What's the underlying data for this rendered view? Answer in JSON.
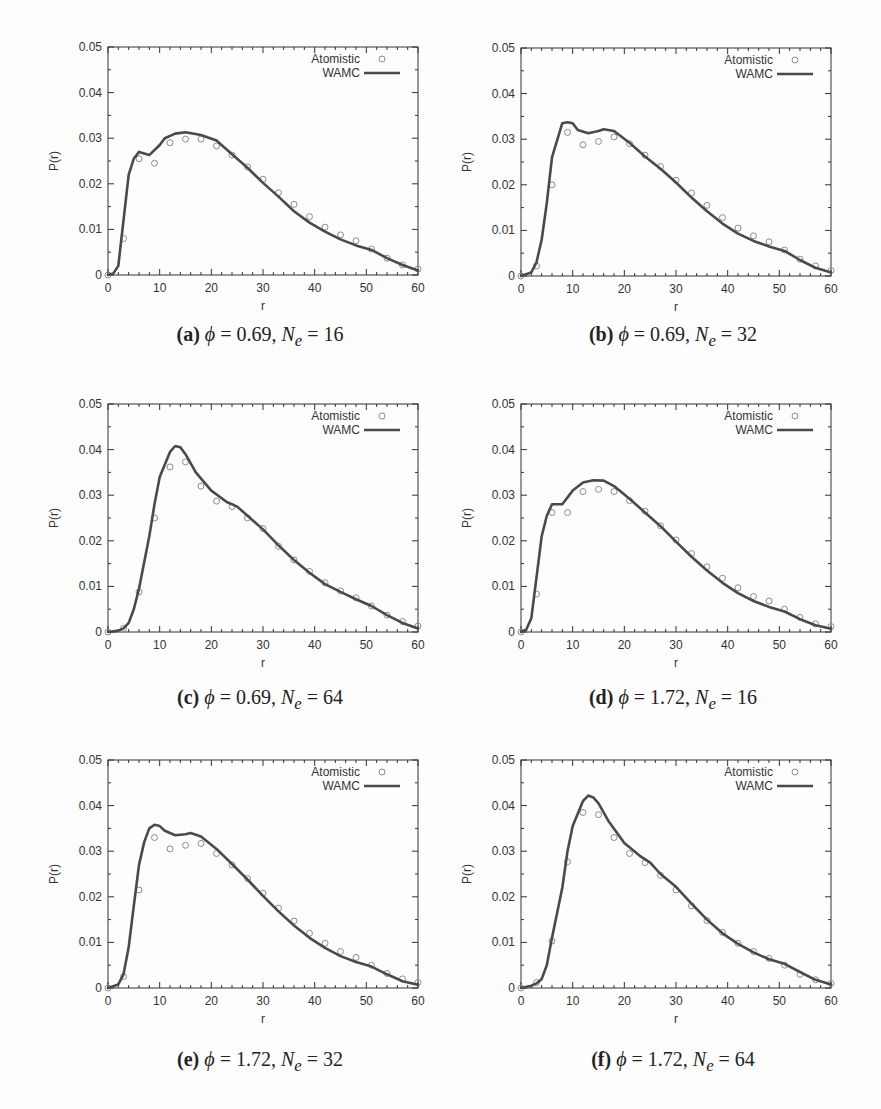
{
  "figure": {
    "panels": [
      {
        "id": "a",
        "label": "(a)",
        "phi": "0.69",
        "ne": "16"
      },
      {
        "id": "b",
        "label": "(b)",
        "phi": "0.69",
        "ne": "32"
      },
      {
        "id": "c",
        "label": "(c)",
        "phi": "0.69",
        "ne": "64"
      },
      {
        "id": "d",
        "label": "(d)",
        "phi": "1.72",
        "ne": "16"
      },
      {
        "id": "e",
        "label": "(e)",
        "phi": "1.72",
        "ne": "32"
      },
      {
        "id": "f",
        "label": "(f)",
        "phi": "1.72",
        "ne": "64"
      }
    ],
    "caption_phi_symbol": "ϕ",
    "caption_ne_symbol": "N",
    "caption_ne_sub": "e",
    "caption_eq": " = ",
    "caption_sep": ", "
  },
  "colors": {
    "curve": "#4a4a4a",
    "markers": "#8c8c8c",
    "axes": "#333333"
  },
  "chart_data": [
    {
      "type": "line",
      "panel": "a",
      "title": "(a) ϕ = 0.69, Ne = 16",
      "xlabel": "r",
      "ylabel": "P(r)",
      "xlim": [
        0,
        60
      ],
      "ylim": [
        0,
        0.05
      ],
      "xticks": [
        0,
        10,
        20,
        30,
        40,
        50,
        60
      ],
      "yticks": [
        "0",
        "0.01",
        "0.02",
        "0.03",
        "0.04",
        "0.05"
      ],
      "grid": false,
      "legend_position": "top-right",
      "series": [
        {
          "name": "Atomistic",
          "style": "open-circle",
          "x": [
            0,
            3,
            6,
            9,
            12,
            15,
            18,
            21,
            24,
            27,
            30,
            33,
            36,
            39,
            42,
            45,
            48,
            51,
            54,
            57,
            60
          ],
          "y": [
            0,
            0.008,
            0.0255,
            0.0245,
            0.029,
            0.0298,
            0.0298,
            0.0283,
            0.0263,
            0.0237,
            0.021,
            0.018,
            0.0155,
            0.0128,
            0.0105,
            0.0088,
            0.0075,
            0.0057,
            0.0037,
            0.0022,
            0.0013
          ]
        },
        {
          "name": "WAMC",
          "style": "line",
          "x": [
            0,
            1,
            2,
            3,
            4,
            5,
            6,
            8,
            10,
            11,
            13,
            15,
            18,
            21,
            24,
            27,
            30,
            33,
            36,
            39,
            42,
            45,
            48,
            51,
            54,
            57,
            60
          ],
          "y": [
            0,
            0.0003,
            0.002,
            0.012,
            0.022,
            0.0255,
            0.027,
            0.0263,
            0.0285,
            0.03,
            0.031,
            0.0313,
            0.0307,
            0.0295,
            0.0265,
            0.0235,
            0.0202,
            0.0172,
            0.014,
            0.0115,
            0.0095,
            0.0078,
            0.0065,
            0.0055,
            0.0037,
            0.0022,
            0.001
          ]
        }
      ]
    },
    {
      "type": "line",
      "panel": "b",
      "title": "(b) ϕ = 0.69, Ne = 32",
      "xlabel": "r",
      "ylabel": "P(r)",
      "xlim": [
        0,
        60
      ],
      "ylim": [
        0,
        0.05
      ],
      "xticks": [
        0,
        10,
        20,
        30,
        40,
        50,
        60
      ],
      "yticks": [
        "0",
        "0.01",
        "0.02",
        "0.03",
        "0.04",
        "0.05"
      ],
      "grid": false,
      "legend_position": "top-right",
      "series": [
        {
          "name": "Atomistic",
          "style": "open-circle",
          "x": [
            0,
            3,
            6,
            9,
            12,
            15,
            18,
            21,
            24,
            27,
            30,
            33,
            36,
            39,
            42,
            45,
            48,
            51,
            54,
            57,
            60
          ],
          "y": [
            0,
            0.0022,
            0.02,
            0.0315,
            0.0288,
            0.0295,
            0.0305,
            0.029,
            0.0265,
            0.024,
            0.021,
            0.0182,
            0.0155,
            0.0128,
            0.0105,
            0.0088,
            0.0075,
            0.0057,
            0.0037,
            0.0022,
            0.0012
          ]
        },
        {
          "name": "WAMC",
          "style": "line",
          "x": [
            0,
            2,
            3,
            4,
            5,
            6,
            8,
            9,
            10,
            11,
            13,
            15,
            16,
            18,
            21,
            24,
            27,
            30,
            33,
            36,
            39,
            42,
            45,
            48,
            51,
            54,
            57,
            60
          ],
          "y": [
            0,
            0.0008,
            0.003,
            0.008,
            0.016,
            0.026,
            0.0335,
            0.0337,
            0.0335,
            0.032,
            0.0313,
            0.0318,
            0.0322,
            0.0318,
            0.0292,
            0.0262,
            0.0235,
            0.0205,
            0.0172,
            0.0142,
            0.0115,
            0.0093,
            0.0077,
            0.0065,
            0.0055,
            0.0035,
            0.0018,
            0.0008
          ]
        }
      ]
    },
    {
      "type": "line",
      "panel": "c",
      "title": "(c) ϕ = 0.69, Ne = 64",
      "xlabel": "r",
      "ylabel": "P(r)",
      "xlim": [
        0,
        60
      ],
      "ylim": [
        0,
        0.05
      ],
      "xticks": [
        0,
        10,
        20,
        30,
        40,
        50,
        60
      ],
      "yticks": [
        "0",
        "0.01",
        "0.02",
        "0.03",
        "0.04",
        "0.05"
      ],
      "grid": false,
      "legend_position": "top-right",
      "series": [
        {
          "name": "Atomistic",
          "style": "open-circle",
          "x": [
            0,
            3,
            6,
            9,
            12,
            15,
            18,
            21,
            24,
            27,
            30,
            33,
            36,
            39,
            42,
            45,
            48,
            51,
            54,
            57,
            60
          ],
          "y": [
            0,
            0.0008,
            0.0088,
            0.025,
            0.0362,
            0.0373,
            0.032,
            0.0287,
            0.0275,
            0.025,
            0.0227,
            0.0188,
            0.0158,
            0.0133,
            0.0108,
            0.009,
            0.0075,
            0.0057,
            0.0037,
            0.0023,
            0.0013
          ]
        },
        {
          "name": "WAMC",
          "style": "line",
          "x": [
            0,
            2,
            3,
            4,
            5,
            6,
            8,
            9,
            10,
            12,
            13,
            14,
            15,
            17,
            20,
            23,
            25,
            27,
            30,
            33,
            36,
            39,
            42,
            45,
            48,
            51,
            54,
            57,
            60
          ],
          "y": [
            0,
            0.0003,
            0.0008,
            0.002,
            0.005,
            0.0095,
            0.021,
            0.028,
            0.034,
            0.0395,
            0.0408,
            0.0405,
            0.039,
            0.035,
            0.031,
            0.0285,
            0.0275,
            0.0255,
            0.0225,
            0.019,
            0.0158,
            0.013,
            0.0105,
            0.0088,
            0.0072,
            0.0057,
            0.0037,
            0.002,
            0.0008
          ]
        }
      ]
    },
    {
      "type": "line",
      "panel": "d",
      "title": "(d) ϕ = 1.72, Ne = 16",
      "xlabel": "r",
      "ylabel": "P(r)",
      "xlim": [
        0,
        60
      ],
      "ylim": [
        0,
        0.05
      ],
      "xticks": [
        0,
        10,
        20,
        30,
        40,
        50,
        60
      ],
      "yticks": [
        "0",
        "0.01",
        "0.02",
        "0.03",
        "0.04",
        "0.05"
      ],
      "grid": false,
      "legend_position": "top-right",
      "series": [
        {
          "name": "Atomistic",
          "style": "open-circle",
          "x": [
            0,
            3,
            6,
            9,
            12,
            15,
            18,
            21,
            24,
            27,
            30,
            33,
            36,
            39,
            42,
            45,
            48,
            51,
            54,
            57,
            60
          ],
          "y": [
            0,
            0.0083,
            0.0262,
            0.0262,
            0.0308,
            0.0313,
            0.0308,
            0.0288,
            0.0265,
            0.0233,
            0.0202,
            0.0172,
            0.0143,
            0.0118,
            0.0097,
            0.0078,
            0.0068,
            0.005,
            0.0032,
            0.0018,
            0.0012
          ]
        },
        {
          "name": "WAMC",
          "style": "line",
          "x": [
            0,
            1,
            2,
            3,
            4,
            5,
            6,
            8,
            10,
            12,
            14,
            16,
            18,
            21,
            24,
            27,
            30,
            33,
            36,
            39,
            42,
            45,
            48,
            51,
            54,
            57,
            60
          ],
          "y": [
            0,
            0.0005,
            0.003,
            0.012,
            0.021,
            0.0255,
            0.028,
            0.028,
            0.031,
            0.0328,
            0.0333,
            0.0332,
            0.032,
            0.0292,
            0.0262,
            0.0232,
            0.0198,
            0.0165,
            0.0135,
            0.0108,
            0.0085,
            0.0068,
            0.0055,
            0.0045,
            0.0028,
            0.0015,
            0.0007
          ]
        }
      ]
    },
    {
      "type": "line",
      "panel": "e",
      "title": "(e) ϕ = 1.72, Ne = 32",
      "xlabel": "r",
      "ylabel": "P(r)",
      "xlim": [
        0,
        60
      ],
      "ylim": [
        0,
        0.05
      ],
      "xticks": [
        0,
        10,
        20,
        30,
        40,
        50,
        60
      ],
      "yticks": [
        "0",
        "0.01",
        "0.02",
        "0.03",
        "0.04",
        "0.05"
      ],
      "grid": false,
      "legend_position": "top-right",
      "series": [
        {
          "name": "Atomistic",
          "style": "open-circle",
          "x": [
            0,
            3,
            6,
            9,
            12,
            15,
            18,
            21,
            24,
            27,
            30,
            33,
            36,
            39,
            42,
            45,
            48,
            51,
            54,
            57,
            60
          ],
          "y": [
            0,
            0.0025,
            0.0215,
            0.033,
            0.0305,
            0.0313,
            0.0317,
            0.0295,
            0.027,
            0.024,
            0.0208,
            0.0175,
            0.0147,
            0.012,
            0.0098,
            0.008,
            0.0067,
            0.005,
            0.0032,
            0.002,
            0.0012
          ]
        },
        {
          "name": "WAMC",
          "style": "line",
          "x": [
            0,
            2,
            3,
            4,
            5,
            6,
            7,
            8,
            9,
            10,
            11,
            13,
            15,
            16,
            18,
            21,
            24,
            27,
            30,
            33,
            36,
            39,
            42,
            45,
            48,
            51,
            54,
            57,
            60
          ],
          "y": [
            0,
            0.0008,
            0.003,
            0.009,
            0.018,
            0.027,
            0.032,
            0.035,
            0.0358,
            0.0355,
            0.0345,
            0.0335,
            0.0337,
            0.034,
            0.0332,
            0.0305,
            0.0272,
            0.0238,
            0.0202,
            0.0168,
            0.0137,
            0.011,
            0.0088,
            0.007,
            0.0057,
            0.0047,
            0.003,
            0.0015,
            0.0007
          ]
        }
      ]
    },
    {
      "type": "line",
      "panel": "f",
      "title": "(f) ϕ = 1.72, Ne = 64",
      "xlabel": "r",
      "ylabel": "P(r)",
      "xlim": [
        0,
        60
      ],
      "ylim": [
        0,
        0.05
      ],
      "xticks": [
        0,
        10,
        20,
        30,
        40,
        50,
        60
      ],
      "yticks": [
        "0",
        "0.01",
        "0.02",
        "0.03",
        "0.04",
        "0.05"
      ],
      "grid": false,
      "legend_position": "top-right",
      "series": [
        {
          "name": "Atomistic",
          "style": "open-circle",
          "x": [
            0,
            3,
            6,
            9,
            12,
            15,
            18,
            21,
            24,
            27,
            30,
            33,
            36,
            39,
            42,
            45,
            48,
            51,
            54,
            57,
            60
          ],
          "y": [
            0,
            0.0012,
            0.0103,
            0.0277,
            0.0385,
            0.038,
            0.033,
            0.0295,
            0.0275,
            0.0247,
            0.0215,
            0.018,
            0.0148,
            0.0122,
            0.0098,
            0.008,
            0.0065,
            0.005,
            0.003,
            0.0018,
            0.001
          ]
        },
        {
          "name": "WAMC",
          "style": "line",
          "x": [
            0,
            2,
            3,
            4,
            5,
            6,
            8,
            9,
            10,
            12,
            13,
            14,
            15,
            17,
            20,
            23,
            25,
            27,
            30,
            33,
            36,
            39,
            42,
            45,
            48,
            51,
            54,
            57,
            60
          ],
          "y": [
            0,
            0.0005,
            0.001,
            0.002,
            0.005,
            0.011,
            0.022,
            0.03,
            0.0355,
            0.041,
            0.0422,
            0.0418,
            0.0405,
            0.0365,
            0.0318,
            0.029,
            0.0275,
            0.025,
            0.0222,
            0.0185,
            0.015,
            0.012,
            0.0097,
            0.0078,
            0.0063,
            0.0053,
            0.0035,
            0.0018,
            0.0008
          ]
        }
      ]
    }
  ]
}
